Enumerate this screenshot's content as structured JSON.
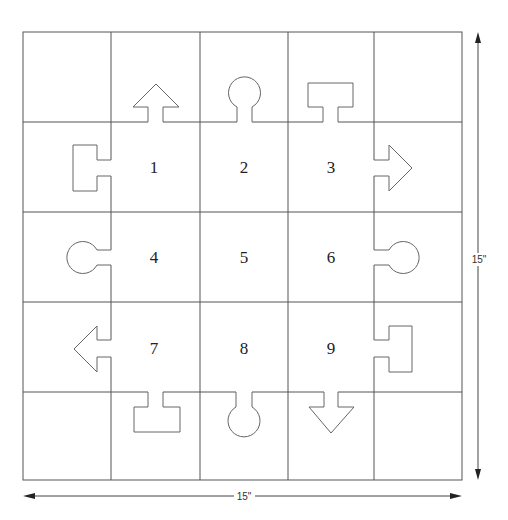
{
  "diagram": {
    "grid": {
      "rows": 5,
      "cols": 5
    },
    "cells": [
      {
        "label": "1",
        "row": 1,
        "col": 1
      },
      {
        "label": "2",
        "row": 1,
        "col": 2
      },
      {
        "label": "3",
        "row": 1,
        "col": 3
      },
      {
        "label": "4",
        "row": 2,
        "col": 1
      },
      {
        "label": "5",
        "row": 2,
        "col": 2
      },
      {
        "label": "6",
        "row": 2,
        "col": 3
      },
      {
        "label": "7",
        "row": 3,
        "col": 1
      },
      {
        "label": "8",
        "row": 3,
        "col": 2
      },
      {
        "label": "9",
        "row": 3,
        "col": 3
      }
    ],
    "tabs": {
      "top": [
        "arrow-up",
        "keyhole",
        "t-shape"
      ],
      "right": [
        "arrow-right",
        "keyhole",
        "t-shape"
      ],
      "bottom": [
        "t-shape",
        "keyhole",
        "arrow-down"
      ],
      "left": [
        "t-shape",
        "keyhole",
        "arrow-left"
      ]
    },
    "dimensions": {
      "width_label": "15\"",
      "height_label": "15\""
    },
    "colors": {
      "line": "#555555",
      "text": "#222222",
      "background": "#ffffff"
    }
  }
}
